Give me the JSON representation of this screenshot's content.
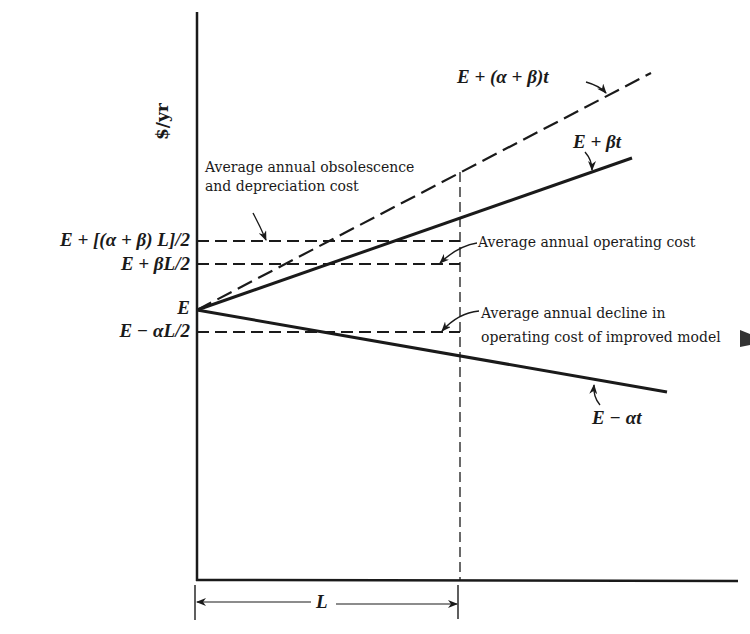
{
  "diagram": {
    "y_axis_label": "$/yr",
    "origin_label": "E",
    "y_tick_labels": {
      "obsolescence_level": "E + [(α + β) L]/2",
      "operating_level": "E + βL/2",
      "origin": "E",
      "decline_level": "E − αL/2"
    },
    "line_labels": {
      "total": "E + (α + β)t",
      "operating": "E + βt",
      "improved": "E − αt"
    },
    "annotations": {
      "obsolescence": [
        "Average annual obsolescence",
        "and depreciation cost"
      ],
      "operating": "Average annual operating cost",
      "decline": [
        "Average annual decline in",
        "operating cost of improved model"
      ]
    },
    "x_dimension_label": "L",
    "colors": {
      "ink": "#1a1a1a",
      "background": "#ffffff"
    }
  }
}
